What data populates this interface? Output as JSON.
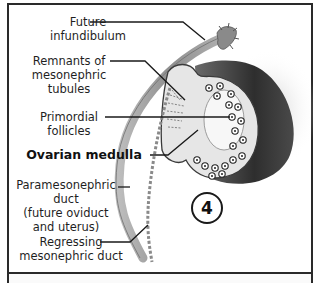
{
  "figure": {
    "stage_number": "4",
    "colors": {
      "frame": "#2a2a2a",
      "duct": "#9a9a9a",
      "ovary_cortex": "#3c3c3c",
      "medulla": "#eeeeee",
      "label_text": "#1f1f1f"
    },
    "labels": [
      {
        "id": "future-infundibulum",
        "lines": [
          "Future",
          "infundibulum"
        ],
        "bold": false
      },
      {
        "id": "remnants-mesonephric-tubules",
        "lines": [
          "Remnants of",
          "mesonephric",
          "tubules"
        ],
        "bold": false
      },
      {
        "id": "primordial-follicles",
        "lines": [
          "Primordial",
          "follicles"
        ],
        "bold": false
      },
      {
        "id": "ovarian-medulla",
        "lines": [
          "Ovarian medulla"
        ],
        "bold": true
      },
      {
        "id": "paramesonephric-duct",
        "lines": [
          "Paramesonephric",
          "duct",
          "(future oviduct",
          "and uterus)"
        ],
        "bold": false
      },
      {
        "id": "regressing-mesonephric-duct",
        "lines": [
          "Regressing",
          "mesonephric duct"
        ],
        "bold": false
      }
    ]
  }
}
